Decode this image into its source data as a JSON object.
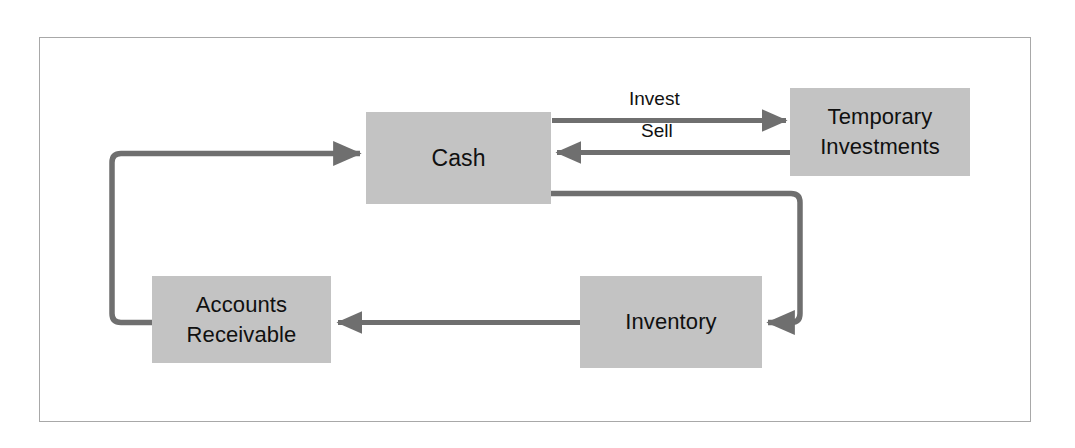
{
  "diagram": {
    "type": "flow-diagram",
    "frame": {
      "border_color": "#a8a8a8"
    },
    "colors": {
      "node_fill": "#c3c3c3",
      "node_text": "#101010",
      "connector": "#6f6f6f",
      "frame_border": "#a8a8a8",
      "background": "#ffffff"
    },
    "nodes": [
      {
        "id": "cash",
        "label": "Cash"
      },
      {
        "id": "temporary-investments",
        "label": "Temporary\nInvestments"
      },
      {
        "id": "inventory",
        "label": "Inventory"
      },
      {
        "id": "accounts-receivable",
        "label": "Accounts\nReceivable"
      }
    ],
    "edges": [
      {
        "id": "invest",
        "from": "cash",
        "to": "temporary-investments",
        "label": "Invest"
      },
      {
        "id": "sell",
        "from": "temporary-investments",
        "to": "cash",
        "label": "Sell"
      },
      {
        "id": "cash-to-inventory",
        "from": "cash",
        "to": "inventory",
        "label": ""
      },
      {
        "id": "inventory-to-accounts-receivable",
        "from": "inventory",
        "to": "accounts-receivable",
        "label": ""
      },
      {
        "id": "accounts-receivable-to-cash",
        "from": "accounts-receivable",
        "to": "cash",
        "label": ""
      }
    ]
  }
}
